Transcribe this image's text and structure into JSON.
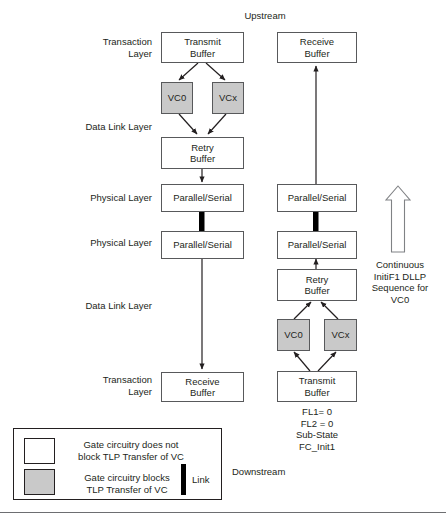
{
  "diagram": {
    "title_top": "Upstream",
    "title_bottom": "Downstream",
    "layer_labels": [
      {
        "text": "Transaction\nLayer"
      },
      {
        "text": "Data Link Layer"
      },
      {
        "text": "Physical Layer"
      },
      {
        "text": "Physical Layer"
      },
      {
        "text": "Data Link Layer"
      },
      {
        "text": "Transaction\nLayer"
      }
    ],
    "left_column": [
      {
        "name": "transmit-buffer",
        "text": "Transmit\nBuffer",
        "fill": "white"
      },
      {
        "name": "vc0",
        "text": "VC0",
        "fill": "gray"
      },
      {
        "name": "vcx",
        "text": "VCx",
        "fill": "gray"
      },
      {
        "name": "retry-buffer",
        "text": "Retry\nBuffer",
        "fill": "white"
      },
      {
        "name": "parallel-serial-upper",
        "text": "Parallel/Serial",
        "fill": "white"
      },
      {
        "name": "parallel-serial-lower",
        "text": "Parallel/Serial",
        "fill": "white"
      },
      {
        "name": "receive-buffer",
        "text": "Receive\nBuffer",
        "fill": "white"
      }
    ],
    "right_column": [
      {
        "name": "receive-buffer",
        "text": "Receive\nBuffer",
        "fill": "white"
      },
      {
        "name": "parallel-serial-upper",
        "text": "Parallel/Serial",
        "fill": "white"
      },
      {
        "name": "parallel-serial-lower",
        "text": "Parallel/Serial",
        "fill": "white"
      },
      {
        "name": "retry-buffer",
        "text": "Retry\nBuffer",
        "fill": "white"
      },
      {
        "name": "vc0",
        "text": "VC0",
        "fill": "gray"
      },
      {
        "name": "vcx",
        "text": "VCx",
        "fill": "gray"
      },
      {
        "name": "transmit-buffer",
        "text": "Transmit\nBuffer",
        "fill": "white"
      }
    ],
    "annotation_dllp": "Continuous\nInitiF1 DLLP\nSequence for\nVC0",
    "annotation_state": "FL1= 0\nFL2 = 0\nSub-State\nFC_Init1"
  },
  "legend": {
    "item_white": "Gate circuitry does not\nblock TLP Transfer of VC",
    "item_gray": "Gate circuitry blocks\nTLP Transfer of VC",
    "link_label": "Link"
  },
  "colors": {
    "gray_fill": "#c9c9c9",
    "box_stroke": "#58595b",
    "text": "#231f20",
    "arrow": "#231f20",
    "link_black": "#000000",
    "arrow_outline": "#808285"
  }
}
